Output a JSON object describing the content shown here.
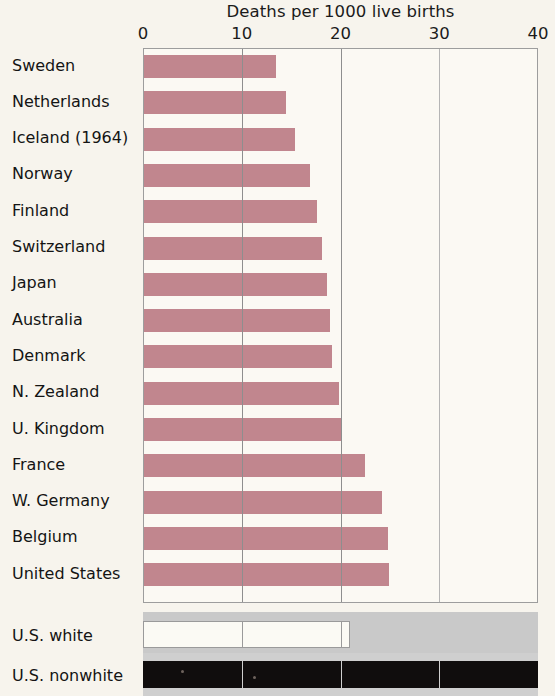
{
  "chart_data": {
    "type": "bar",
    "orientation": "horizontal",
    "title": "Deaths per 1000 live births",
    "xlabel": "",
    "ylabel": "",
    "xlim": [
      0,
      40
    ],
    "xticks": [
      0,
      10,
      20,
      30,
      40
    ],
    "xtick_labels": [
      "0",
      "10",
      "20",
      "30",
      "40"
    ],
    "grid": true,
    "grid_axis": "x",
    "legend": "none",
    "bar_color": "#c1868e",
    "categories": [
      "Sweden",
      "Netherlands",
      "Iceland (1964)",
      "Norway",
      "Finland",
      "Switzerland",
      "Japan",
      "Australia",
      "Denmark",
      "N. Zealand",
      "U. Kingdom",
      "France",
      "W. Germany",
      "Belgium",
      "United States"
    ],
    "values": [
      13.4,
      14.4,
      15.3,
      16.8,
      17.5,
      18.0,
      18.5,
      18.8,
      19.0,
      19.7,
      19.9,
      22.4,
      24.1,
      24.7,
      24.8
    ],
    "secondary_panel": {
      "categories": [
        "U.S. white",
        "U.S. nonwhite"
      ],
      "values": [
        21.0,
        40.0
      ],
      "colors": [
        "#fbfaf4",
        "#100d0d"
      ],
      "band_color": "#c9c9c9"
    }
  },
  "bottom": {
    "label_white": "U.S. white",
    "label_nonwhite": "U.S. nonwhite"
  }
}
